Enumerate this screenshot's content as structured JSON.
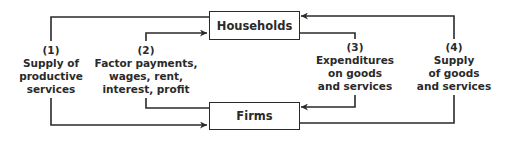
{
  "diagram": {
    "type": "circular-flow",
    "nodes": {
      "households": {
        "label": "Households"
      },
      "firms": {
        "label": "Firms"
      }
    },
    "flows": [
      {
        "number": "(1)",
        "lines": [
          "Supply of",
          "productive",
          "services"
        ],
        "from": "Households",
        "to": "Firms"
      },
      {
        "number": "(2)",
        "lines": [
          "Factor payments,",
          "wages, rent,",
          "interest, profit"
        ],
        "from": "Firms",
        "to": "Households"
      },
      {
        "number": "(3)",
        "lines": [
          "Expenditures",
          "on goods",
          "and services"
        ],
        "from": "Households",
        "to": "Firms"
      },
      {
        "number": "(4)",
        "lines": [
          "Supply",
          "of goods",
          "and services"
        ],
        "from": "Firms",
        "to": "Households"
      }
    ],
    "colors": {
      "line": "#2a2a2a",
      "background": "#ffffff"
    }
  }
}
